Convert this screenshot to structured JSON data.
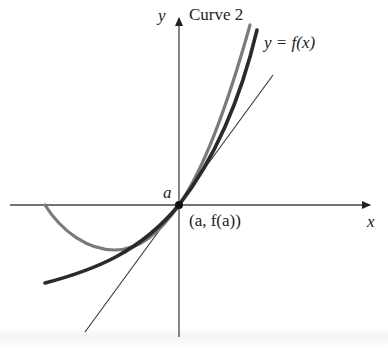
{
  "diagram": {
    "labels": {
      "y_axis": "y",
      "x_axis": "x",
      "curve2": "Curve 2",
      "f_curve": "y = f(x)",
      "a_tick": "a",
      "point": "(a, f(a))"
    },
    "colors": {
      "axis": "#333333",
      "f_curve": "#2a2a2a",
      "curve2": "#777777",
      "tangent": "#333333",
      "point": "#111111"
    },
    "elements": [
      {
        "id": "x-axis",
        "type": "arrow",
        "from": [
          10,
          205
        ],
        "to": [
          378,
          205
        ]
      },
      {
        "id": "y-axis",
        "type": "arrow",
        "from": [
          179,
          337
        ],
        "to": [
          179,
          10
        ]
      },
      {
        "id": "tangent-line",
        "type": "line",
        "from": [
          85,
          332
        ],
        "to": [
          273,
          75
        ]
      },
      {
        "id": "f-curve",
        "type": "curve",
        "start": [
          45,
          283
        ],
        "end": [
          257,
          30
        ]
      },
      {
        "id": "curve-2",
        "type": "curve",
        "start": [
          45,
          205
        ],
        "min": [
          115,
          250
        ],
        "end": [
          250,
          25
        ]
      },
      {
        "id": "tangency-point",
        "type": "point",
        "at": [
          179,
          205
        ]
      }
    ]
  }
}
